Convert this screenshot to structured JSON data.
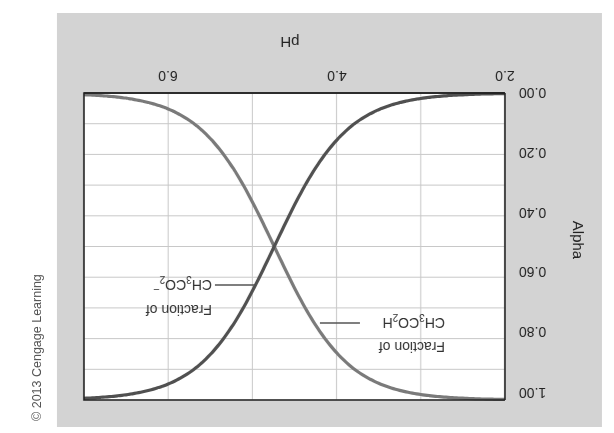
{
  "chart_data": {
    "type": "line",
    "title": "",
    "xlabel": "pH",
    "ylabel": "Alpha",
    "xlim": [
      2.0,
      7.0
    ],
    "ylim": [
      0.0,
      1.0
    ],
    "grid": true,
    "x_ticks": [
      "2.0",
      "4.0",
      "6.0"
    ],
    "y_ticks": [
      "0.00",
      "0.20",
      "0.40",
      "0.60",
      "0.80",
      "1.00"
    ],
    "x": [
      2.0,
      2.5,
      3.0,
      3.5,
      4.0,
      4.25,
      4.5,
      4.74,
      5.0,
      5.25,
      5.5,
      6.0,
      6.5,
      7.0
    ],
    "series": [
      {
        "name": "Fraction of CH3CO2H",
        "color": "#7a7a7a",
        "values": [
          1.0,
          0.99,
          0.98,
          0.95,
          0.85,
          0.76,
          0.63,
          0.5,
          0.35,
          0.24,
          0.15,
          0.05,
          0.02,
          0.01
        ]
      },
      {
        "name": "Fraction of CH3CO2-",
        "color": "#505050",
        "values": [
          0.0,
          0.01,
          0.02,
          0.05,
          0.15,
          0.24,
          0.37,
          0.5,
          0.65,
          0.76,
          0.85,
          0.95,
          0.98,
          0.99
        ]
      }
    ],
    "annotations": [
      {
        "text_line1": "Fraction of",
        "text_line2_main": "CH",
        "sub1": "3",
        "mid": "CO",
        "sub2": "2",
        "tail": "H",
        "series": "Fraction of CH3CO2H"
      },
      {
        "text_line1": "Fraction of",
        "text_line2_main": "CH",
        "sub1": "3",
        "mid": "CO",
        "sub2": "2",
        "tail": "−",
        "series": "Fraction of CH3CO2-"
      }
    ],
    "crossing": {
      "pH": 4.74,
      "alpha": 0.5
    },
    "orientation_note": "image rotated 180 degrees"
  },
  "credit": "© 2013 Cengage Learning",
  "colors": {
    "panel_bg": "#d3d3d3",
    "plot_bg": "#ffffff",
    "grid": "#c8c8c8",
    "axis": "#222222",
    "acid_curve": "#7a7a7a",
    "base_curve": "#505050"
  }
}
